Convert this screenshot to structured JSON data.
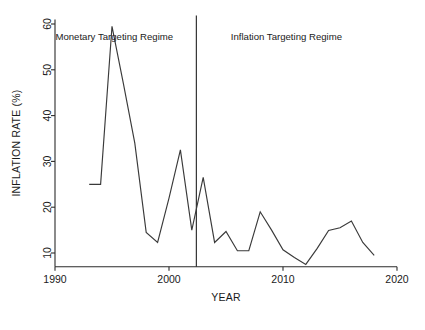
{
  "chart_data": {
    "type": "line",
    "title": "",
    "xlabel": "YEAR",
    "ylabel": "INFLATION RATE (%)",
    "xlim": [
      1990,
      2020
    ],
    "ylim": [
      7,
      61
    ],
    "grid": false,
    "legend": "none",
    "xticks": [
      "1990",
      "2000",
      "2010",
      "2020"
    ],
    "xtick_values": [
      1990,
      2000,
      2010,
      2020
    ],
    "yticks": [
      "10",
      "20",
      "30",
      "40",
      "50",
      "60"
    ],
    "ytick_values": [
      10,
      20,
      30,
      40,
      50,
      60
    ],
    "series": [
      {
        "name": "Inflation rate",
        "color": "#3a3a3a",
        "x": [
          1993,
          1994,
          1995,
          1996,
          1997,
          1998,
          1999,
          2000,
          2001,
          2002,
          2003,
          2004,
          2005,
          2006,
          2007,
          2008,
          2009,
          2010,
          2011,
          2012,
          2013,
          2014,
          2015,
          2016,
          2017,
          2018
        ],
        "values": [
          25.0,
          25.0,
          59.5,
          47.0,
          34.0,
          14.5,
          12.3,
          22.0,
          32.5,
          15.0,
          26.5,
          12.3,
          14.7,
          10.5,
          10.5,
          19.0,
          15.0,
          10.7,
          9.0,
          7.5,
          11.0,
          14.9,
          15.5,
          17.0,
          12.3,
          9.5
        ]
      }
    ],
    "annotations": [
      {
        "name": "monetary-targeting-regime",
        "text": "Monetary Targeting Regime",
        "x": 1995.2,
        "y": 56.5
      },
      {
        "name": "inflation-targeting-regime",
        "text": "Inflation Targeting Regime",
        "x": 2010.3,
        "y": 56.5
      }
    ],
    "vlines": [
      {
        "name": "regime-divider",
        "x": 2002.4,
        "color": "#2b2b2b"
      }
    ]
  },
  "caption": {
    "text": ""
  }
}
